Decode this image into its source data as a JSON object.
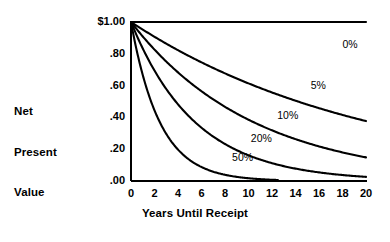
{
  "chart_data": {
    "type": "line",
    "title": "",
    "xlabel": "Years Until Receipt",
    "ylabel": "Net Present Value",
    "ylabel_lines": [
      "Net",
      "Present",
      "Value"
    ],
    "x": [
      0,
      2,
      4,
      6,
      8,
      10,
      12,
      14,
      16,
      18,
      20
    ],
    "xlim": [
      0,
      20
    ],
    "ylim": [
      0.0,
      1.0
    ],
    "grid": false,
    "legend_position": "inline-annotations",
    "xtick_labels": [
      "0",
      "2",
      "4",
      "6",
      "8",
      "10",
      "12",
      "14",
      "16",
      "18",
      "20"
    ],
    "xtick_values": [
      0,
      2,
      4,
      6,
      8,
      10,
      12,
      14,
      16,
      18,
      20
    ],
    "ytick_labels": [
      "$1.00",
      ".80",
      ".60",
      ".40",
      ".20",
      ".00"
    ],
    "ytick_values": [
      1.0,
      0.8,
      0.6,
      0.4,
      0.2,
      0.0
    ],
    "series": [
      {
        "name": "0%",
        "rate": 0.0,
        "label": "0%",
        "label_x": 18.0,
        "label_y": 0.855,
        "x_end": 20,
        "values": [
          1.0,
          1.0,
          1.0,
          1.0,
          1.0,
          1.0,
          1.0,
          1.0,
          1.0,
          1.0,
          1.0
        ]
      },
      {
        "name": "5%",
        "rate": 0.05,
        "label": "5%",
        "label_x": 15.3,
        "label_y": 0.595,
        "x_end": 20,
        "values": [
          1.0,
          0.907,
          0.823,
          0.746,
          0.677,
          0.614,
          0.557,
          0.505,
          0.458,
          0.416,
          0.377
        ]
      },
      {
        "name": "10%",
        "rate": 0.1,
        "label": "10%",
        "label_x": 12.45,
        "label_y": 0.41,
        "x_end": 20,
        "values": [
          1.0,
          0.826,
          0.683,
          0.564,
          0.467,
          0.386,
          0.319,
          0.263,
          0.218,
          0.18,
          0.149
        ]
      },
      {
        "name": "20%",
        "rate": 0.2,
        "label": "20%",
        "label_x": 10.2,
        "label_y": 0.265,
        "x_end": 20,
        "values": [
          1.0,
          0.694,
          0.482,
          0.335,
          0.233,
          0.162,
          0.112,
          0.078,
          0.054,
          0.038,
          0.026
        ]
      },
      {
        "name": "50%",
        "rate": 0.5,
        "label": "50%",
        "label_x": 8.6,
        "label_y": 0.145,
        "x_end": 12.5,
        "values": [
          1.0,
          0.444,
          0.198,
          0.088,
          0.039,
          0.017,
          0.008,
          0.003,
          0.002,
          0.001,
          0.0
        ]
      }
    ]
  },
  "style": {
    "line_color": "#000000",
    "axis_color": "#000000",
    "background": "#ffffff"
  }
}
